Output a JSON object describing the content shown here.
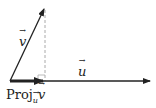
{
  "diagram": {
    "labels": {
      "v": "v",
      "u": "u",
      "proj_prefix": "Proj",
      "proj_sub": "u",
      "proj_vec": "v"
    },
    "colors": {
      "stroke": "#222222",
      "dashed": "#aaaaaa"
    }
  }
}
